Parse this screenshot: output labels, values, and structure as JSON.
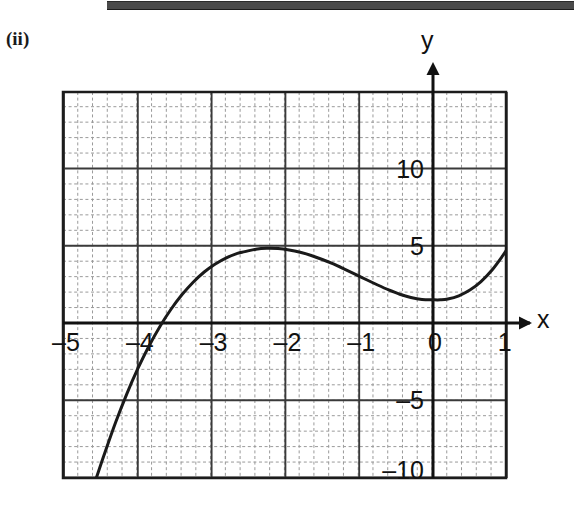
{
  "figure": {
    "part_label": "(ii)",
    "top_rule": "page-rule",
    "axis_labels": {
      "x": "x",
      "y": "y"
    }
  },
  "chart_data": {
    "type": "line",
    "title": "",
    "subtitle": "",
    "xlabel": "x",
    "ylabel": "y",
    "xlim": [
      -5,
      1
    ],
    "ylim": [
      -10,
      11.5
    ],
    "xticks": [
      -5,
      -4,
      -3,
      -2,
      -1,
      0,
      1
    ],
    "xticklabels": [
      "–5",
      "–4",
      "–3",
      "–2",
      "–1",
      "0",
      "1"
    ],
    "yticks": [
      -10,
      -5,
      5,
      10
    ],
    "yticklabels": [
      "–10",
      "–5",
      "5",
      "10"
    ],
    "grid": true,
    "grid_major_step_x": 1,
    "grid_major_step_y": 5,
    "grid_minor_divisions": 5,
    "legend": null,
    "annotations": [],
    "series": [
      {
        "name": "cubic",
        "color": "#1a1a1a",
        "linewidth": 3,
        "local_maximum": {
          "x": -2.55,
          "y": 10.6
        },
        "local_minimum": {
          "x": 0.1,
          "y": 2.0
        },
        "x_intercept_approx": -4.25,
        "y_intercept_approx": 2.1,
        "x": [
          -4.56,
          -4.45,
          -4.3,
          -4.15,
          -4.0,
          -3.85,
          -3.7,
          -3.55,
          -3.4,
          -3.25,
          -3.1,
          -2.95,
          -2.8,
          -2.65,
          -2.55,
          -2.4,
          -2.25,
          -2.1,
          -1.95,
          -1.8,
          -1.65,
          -1.5,
          -1.35,
          -1.2,
          -1.05,
          -0.9,
          -0.75,
          -0.6,
          -0.45,
          -0.3,
          -0.15,
          0.0,
          0.1,
          0.2,
          0.35,
          0.5,
          0.65,
          0.8,
          0.95,
          1.0
        ],
        "y": [
          -10.0,
          -8.45,
          -6.43,
          -4.6,
          -2.96,
          -1.5,
          -0.22,
          0.89,
          1.84,
          2.64,
          3.3,
          3.82,
          4.22,
          4.51,
          4.62,
          4.78,
          4.84,
          4.82,
          4.73,
          4.58,
          4.37,
          4.11,
          3.82,
          3.49,
          3.15,
          2.8,
          2.46,
          2.14,
          1.86,
          1.65,
          1.52,
          1.5,
          1.5,
          1.55,
          1.76,
          2.13,
          2.68,
          3.43,
          4.39,
          4.75
        ]
      }
    ]
  },
  "geometry": {
    "plot_left_px": 63,
    "plot_right_px": 506,
    "plot_top_px": 92,
    "plot_bottom_px": 478,
    "x_axis_y_px": 323,
    "y_axis_x_px": 433,
    "px_per_x_unit": 73.8,
    "px_per_y_unit": 15.45
  },
  "colors": {
    "curve": "#1a1a1a",
    "axis": "#111111",
    "major_grid": "#3a3a3a",
    "minor_grid": "#9a9a9a",
    "border": "#1c1c1c",
    "top_rule": "#4a4a4a",
    "background": "#ffffff"
  }
}
